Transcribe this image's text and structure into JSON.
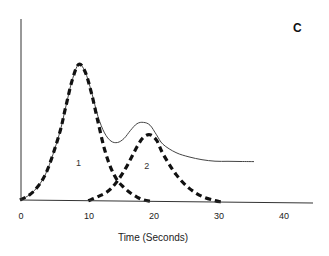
{
  "chart_data": {
    "type": "line",
    "title": "",
    "panel_label": "C",
    "xlabel": "Time (Seconds)",
    "ylabel": "",
    "xlim": [
      0,
      45
    ],
    "ylim": [
      0,
      130
    ],
    "x_ticks": [
      0,
      10,
      20,
      30,
      40
    ],
    "x_tick_labels": [
      "0",
      "10",
      "20",
      "30",
      "40"
    ],
    "y_ticks": [],
    "grid": false,
    "legend": "none",
    "annotations": [
      {
        "text": "1",
        "x": 9,
        "y": 28,
        "target": "component 1"
      },
      {
        "text": "2",
        "x": 19.5,
        "y": 26,
        "target": "component 2"
      }
    ],
    "series": [
      {
        "name": "Total response",
        "style": "solid thin",
        "x": [
          0,
          2,
          4,
          6,
          7,
          8,
          9,
          10,
          11,
          12,
          13,
          14,
          15,
          16,
          17,
          18,
          19,
          20,
          21,
          22,
          24,
          26,
          28,
          30,
          32,
          34,
          36
        ],
        "y": [
          0,
          6,
          20,
          48,
          68,
          88,
          100,
          95,
          80,
          62,
          50,
          44,
          43,
          46,
          52,
          57,
          58,
          56,
          49,
          42,
          36,
          33,
          31,
          30,
          30,
          30,
          30
        ]
      },
      {
        "name": "Component 1",
        "style": "dashed thick",
        "x": [
          0,
          2,
          4,
          6,
          7,
          8,
          9,
          10,
          11,
          12,
          13,
          14,
          15,
          16,
          17,
          18,
          19,
          20
        ],
        "y": [
          0,
          6,
          20,
          48,
          68,
          88,
          100,
          95,
          79,
          58,
          38,
          24,
          15,
          10,
          6,
          3,
          1,
          0
        ]
      },
      {
        "name": "Component 2",
        "style": "dashed thick",
        "x": [
          10.5,
          12,
          14,
          16,
          18,
          19,
          20,
          21,
          22,
          24,
          26,
          28,
          30,
          31
        ],
        "y": [
          0,
          3,
          9,
          22,
          40,
          47,
          49,
          45,
          35,
          20,
          10,
          4,
          1,
          0
        ]
      }
    ]
  }
}
